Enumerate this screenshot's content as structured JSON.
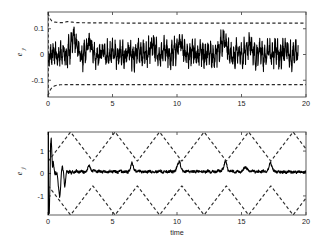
{
  "figure": {
    "background": "#ffffff",
    "width": 326,
    "height": 248,
    "line_color": "#000000",
    "bound_color": "#2b2b2b",
    "axis_color": "#4d4d4d"
  },
  "panels": {
    "top": {
      "ylabel_main": "e",
      "ylabel_sub": "y",
      "ytick_labels": [
        "0.1",
        "0",
        "-0.1"
      ],
      "xtick_labels": [
        "0",
        "5",
        "10",
        "15",
        "20"
      ],
      "xlabel": ""
    },
    "bottom": {
      "ylabel_main": "e",
      "ylabel_sub": "ẏ",
      "ytick_labels": [
        "1",
        "0",
        "-1"
      ],
      "xtick_labels": [
        "0",
        "5",
        "10",
        "15",
        "20"
      ],
      "xlabel": "time"
    }
  },
  "chart_data": [
    {
      "type": "line",
      "title": "",
      "xlabel": "",
      "ylabel": "e_y",
      "xlim": [
        0,
        20
      ],
      "ylim": [
        -0.165,
        0.165
      ],
      "xticks": [
        0,
        5,
        10,
        15,
        20
      ],
      "yticks": [
        0.1,
        0,
        -0.1
      ],
      "grid": false,
      "legend": null,
      "series": [
        {
          "name": "tracking error e_y",
          "style": "solid",
          "color": "#000000",
          "description": "noisy zero-mean tracking error oscillating roughly within +/-0.07, occasional excursions to +/-0.12",
          "x": [
            0.0,
            0.1,
            0.2,
            0.3,
            0.4,
            0.5,
            0.6,
            0.7,
            0.8,
            0.9,
            1.0,
            1.1,
            1.2,
            1.3,
            1.4,
            1.5,
            1.6,
            1.7,
            1.8,
            1.9,
            2.0,
            2.1,
            2.2,
            2.3,
            2.4,
            2.5,
            2.6,
            2.7,
            2.8,
            2.9,
            3.0,
            3.1,
            3.2,
            3.3,
            3.4,
            3.5,
            3.6,
            3.7,
            3.8,
            3.9,
            4.0,
            4.1,
            4.2,
            4.3,
            4.4,
            4.5,
            4.6,
            4.7,
            4.8,
            4.9,
            5.0,
            5.1,
            5.2,
            5.3,
            5.4,
            5.5,
            5.6,
            5.7,
            5.8,
            5.9,
            6.0,
            6.1,
            6.2,
            6.3,
            6.4,
            6.5,
            6.6,
            6.7,
            6.8,
            6.9,
            7.0,
            7.1,
            7.2,
            7.3,
            7.4,
            7.5,
            7.6,
            7.7,
            7.8,
            7.9,
            8.0,
            8.1,
            8.2,
            8.3,
            8.4,
            8.5,
            8.6,
            8.7,
            8.8,
            8.9,
            9.0,
            9.1,
            9.2,
            9.3,
            9.4,
            9.5,
            9.6,
            9.7,
            9.8,
            9.9,
            10.0,
            10.1,
            10.2,
            10.3,
            10.4,
            10.5,
            10.6,
            10.7,
            10.8,
            10.9,
            11.0,
            11.1,
            11.2,
            11.3,
            11.4,
            11.5,
            11.6,
            11.7,
            11.8,
            11.9,
            12.0,
            12.1,
            12.2,
            12.3,
            12.4,
            12.5,
            12.6,
            12.7,
            12.8,
            12.9,
            13.0,
            13.1,
            13.2,
            13.3,
            13.4,
            13.5,
            13.6,
            13.7,
            13.8,
            13.9,
            14.0,
            14.1,
            14.2,
            14.3,
            14.4,
            14.5,
            14.6,
            14.7,
            14.8,
            14.9,
            15.0,
            15.1,
            15.2,
            15.3,
            15.4,
            15.5,
            15.6,
            15.7,
            15.8,
            15.9,
            16.0,
            16.1,
            16.2,
            16.3,
            16.4,
            16.5,
            16.6,
            16.7,
            16.8,
            16.9,
            17.0,
            17.1,
            17.2,
            17.3,
            17.4,
            17.5,
            17.6,
            17.7,
            17.8,
            17.9,
            18.0,
            18.1,
            18.2,
            18.3,
            18.4,
            18.5,
            18.6,
            18.7,
            18.8,
            18.9,
            19.0,
            19.1,
            19.2,
            19.3,
            19.4,
            19.5,
            19.6,
            19.7,
            19.8,
            19.9,
            20.0
          ],
          "y": [
            0.005,
            -0.03,
            0.028,
            -0.022,
            0.035,
            -0.018,
            0.03,
            -0.035,
            0.02,
            -0.028,
            0.038,
            -0.015,
            0.042,
            -0.03,
            0.025,
            -0.04,
            0.055,
            -0.02,
            0.085,
            0.02,
            0.1,
            0.03,
            0.06,
            -0.01,
            0.045,
            -0.035,
            0.03,
            -0.045,
            0.04,
            -0.02,
            0.05,
            0.01,
            0.075,
            0.015,
            0.055,
            -0.025,
            0.035,
            -0.05,
            0.02,
            -0.04,
            0.03,
            -0.03,
            0.045,
            -0.02,
            0.025,
            -0.045,
            0.035,
            -0.03,
            0.04,
            -0.025,
            0.05,
            -0.015,
            0.035,
            -0.04,
            0.028,
            -0.035,
            0.045,
            -0.02,
            0.038,
            -0.045,
            0.03,
            -0.03,
            0.055,
            -0.015,
            0.04,
            -0.038,
            0.025,
            -0.042,
            0.035,
            -0.025,
            0.048,
            -0.018,
            0.03,
            -0.04,
            0.042,
            -0.028,
            0.035,
            -0.045,
            0.05,
            -0.02,
            0.06,
            0.005,
            0.07,
            -0.01,
            0.045,
            -0.035,
            0.03,
            -0.048,
            0.038,
            -0.025,
            0.055,
            -0.015,
            0.042,
            -0.038,
            0.028,
            -0.045,
            0.035,
            -0.03,
            0.05,
            -0.02,
            0.06,
            0.0,
            0.08,
            0.015,
            0.065,
            -0.01,
            0.045,
            -0.038,
            0.032,
            -0.045,
            0.04,
            -0.028,
            0.048,
            -0.02,
            0.035,
            -0.042,
            0.03,
            -0.035,
            0.045,
            -0.025,
            0.038,
            -0.04,
            0.028,
            -0.032,
            0.05,
            -0.018,
            0.04,
            -0.045,
            0.03,
            -0.038,
            0.042,
            -0.022,
            0.055,
            -0.012,
            0.075,
            0.01,
            0.095,
            0.025,
            0.07,
            -0.005,
            0.05,
            -0.03,
            0.035,
            -0.045,
            0.028,
            -0.04,
            0.045,
            -0.022,
            0.038,
            -0.035,
            0.03,
            -0.048,
            0.042,
            -0.025,
            0.06,
            -0.008,
            0.075,
            0.012,
            0.058,
            -0.018,
            0.04,
            -0.042,
            0.03,
            -0.038,
            0.048,
            -0.02,
            0.035,
            -0.045,
            0.028,
            -0.035,
            0.05,
            -0.015,
            0.042,
            -0.04,
            0.03,
            -0.03,
            0.055,
            -0.018,
            0.038,
            -0.045,
            0.032,
            -0.04,
            0.045,
            -0.022,
            0.06,
            -0.01,
            0.048,
            -0.035,
            0.035,
            -0.045,
            0.04,
            -0.028,
            0.052,
            -0.018,
            0.03
          ]
        },
        {
          "name": "upper performance bound",
          "style": "dashed",
          "color": "#2b2b2b",
          "description": "exponentially decaying funnel settling near +0.122",
          "x": [
            0.0,
            0.15,
            0.3,
            0.5,
            0.8,
            1.2,
            1.5,
            1.8,
            2.2,
            3.0,
            4.0,
            6.0,
            8.0,
            10.0,
            12.0,
            14.0,
            16.0,
            18.0,
            20.0
          ],
          "y": [
            0.16,
            0.14,
            0.13,
            0.126,
            0.124,
            0.124,
            0.128,
            0.126,
            0.124,
            0.123,
            0.123,
            0.122,
            0.122,
            0.122,
            0.122,
            0.122,
            0.122,
            0.122,
            0.122
          ]
        },
        {
          "name": "lower performance bound",
          "style": "dashed",
          "color": "#2b2b2b",
          "description": "exponentially decaying funnel settling near -0.118",
          "x": [
            0.0,
            0.15,
            0.3,
            0.5,
            0.8,
            1.2,
            1.5,
            1.8,
            2.2,
            3.0,
            4.0,
            6.0,
            8.0,
            10.0,
            12.0,
            14.0,
            16.0,
            18.0,
            20.0
          ],
          "y": [
            -0.16,
            -0.14,
            -0.128,
            -0.122,
            -0.118,
            -0.117,
            -0.117,
            -0.117,
            -0.117,
            -0.117,
            -0.117,
            -0.117,
            -0.117,
            -0.117,
            -0.117,
            -0.117,
            -0.117,
            -0.117,
            -0.117
          ]
        }
      ]
    },
    {
      "type": "line",
      "title": "",
      "xlabel": "time",
      "ylabel": "e_ydot",
      "xlim": [
        0,
        20
      ],
      "ylim": [
        -1.85,
        1.85
      ],
      "xticks": [
        0,
        5,
        10,
        15,
        20
      ],
      "yticks": [
        1,
        0,
        -1
      ],
      "grid": false,
      "legend": null,
      "series": [
        {
          "name": "velocity tracking error e_ydot",
          "style": "solid",
          "color": "#000000",
          "description": "large transient at t<1.5 reaching +1.6 and -1.8, then settles to small noise about 0 with periodic spikes near t=3.2, 6.5, 10.2, 13.8, 17.3",
          "x": [
            0.0,
            0.05,
            0.1,
            0.15,
            0.2,
            0.25,
            0.3,
            0.35,
            0.4,
            0.45,
            0.5,
            0.55,
            0.6,
            0.65,
            0.7,
            0.75,
            0.8,
            0.85,
            0.9,
            0.95,
            1.0,
            1.05,
            1.1,
            1.15,
            1.2,
            1.25,
            1.3,
            1.35,
            1.4,
            1.45,
            1.5,
            1.6,
            1.7,
            1.8,
            1.9,
            2.0,
            2.2,
            2.4,
            2.6,
            2.8,
            3.0,
            3.1,
            3.2,
            3.3,
            3.4,
            3.6,
            3.8,
            4.0,
            4.2,
            4.4,
            4.6,
            4.8,
            5.0,
            5.2,
            5.4,
            5.6,
            5.8,
            6.0,
            6.2,
            6.35,
            6.5,
            6.6,
            6.7,
            6.9,
            7.1,
            7.3,
            7.5,
            7.7,
            7.9,
            8.1,
            8.3,
            8.5,
            8.7,
            8.9,
            9.1,
            9.3,
            9.5,
            9.7,
            9.9,
            10.05,
            10.2,
            10.3,
            10.45,
            10.6,
            10.8,
            11.0,
            11.2,
            11.4,
            11.6,
            11.8,
            12.0,
            12.2,
            12.4,
            12.6,
            12.8,
            13.0,
            13.2,
            13.4,
            13.6,
            13.75,
            13.85,
            13.95,
            14.1,
            14.3,
            14.5,
            14.7,
            14.9,
            15.1,
            15.3,
            15.5,
            15.7,
            15.9,
            16.1,
            16.3,
            16.5,
            16.7,
            16.9,
            17.1,
            17.25,
            17.35,
            17.5,
            17.7,
            17.9,
            18.1,
            18.3,
            18.5,
            18.7,
            18.9,
            19.1,
            19.3,
            19.5,
            19.7,
            19.9,
            20.0
          ],
          "y": [
            0.0,
            -1.4,
            -1.75,
            -0.5,
            1.3,
            1.55,
            0.9,
            0.25,
            0.55,
            0.3,
            0.1,
            -0.1,
            0.05,
            -0.05,
            0.02,
            -0.2,
            -0.55,
            -0.8,
            -1.05,
            -0.85,
            -0.35,
            0.1,
            0.35,
            0.2,
            0.05,
            -0.3,
            -0.65,
            -0.4,
            -0.05,
            0.15,
            0.08,
            0.05,
            0.12,
            0.02,
            0.1,
            0.05,
            0.12,
            0.06,
            0.1,
            0.05,
            0.12,
            0.28,
            0.34,
            0.2,
            0.1,
            0.14,
            0.08,
            0.12,
            0.06,
            0.1,
            0.05,
            0.12,
            0.07,
            0.1,
            0.04,
            0.12,
            0.06,
            0.1,
            0.05,
            0.18,
            0.5,
            0.35,
            0.15,
            0.08,
            0.12,
            0.05,
            0.1,
            0.06,
            0.12,
            0.05,
            0.1,
            0.06,
            0.12,
            0.05,
            0.1,
            0.06,
            0.12,
            0.05,
            0.15,
            0.4,
            0.58,
            0.3,
            0.12,
            0.08,
            0.12,
            0.05,
            0.1,
            0.06,
            0.12,
            0.05,
            0.1,
            0.06,
            0.12,
            0.05,
            0.1,
            0.06,
            0.14,
            0.1,
            0.25,
            0.62,
            0.4,
            0.15,
            0.08,
            0.12,
            0.05,
            0.1,
            0.06,
            0.16,
            0.3,
            0.16,
            0.08,
            0.12,
            0.05,
            0.1,
            0.06,
            0.12,
            0.08,
            0.24,
            0.52,
            0.3,
            0.12,
            0.06,
            0.1,
            0.04,
            0.08,
            0.05,
            0.1,
            0.04,
            0.08,
            0.05,
            0.1,
            0.04,
            0.08,
            0.05
          ]
        },
        {
          "name": "upper performance bound",
          "style": "dashed",
          "color": "#2b2b2b",
          "description": "periodic triangular/zigzag funnel, period about 3.45, peaks near +1.85 and troughs near +0.55",
          "waveform": "triangle",
          "period": 3.45,
          "peak": 1.85,
          "trough": 0.55,
          "phase_peak_times": [
            1.75,
            5.2,
            8.65,
            12.1,
            15.55,
            19.0
          ]
        },
        {
          "name": "lower performance bound",
          "style": "dashed",
          "color": "#2b2b2b",
          "description": "mirrored periodic triangular/zigzag funnel, troughs near -1.85 and peaks near -0.55",
          "waveform": "triangle",
          "period": 3.45,
          "peak": -1.85,
          "trough": -0.55,
          "phase_peak_times": [
            1.75,
            5.2,
            8.65,
            12.1,
            15.55,
            19.0
          ]
        }
      ]
    }
  ]
}
